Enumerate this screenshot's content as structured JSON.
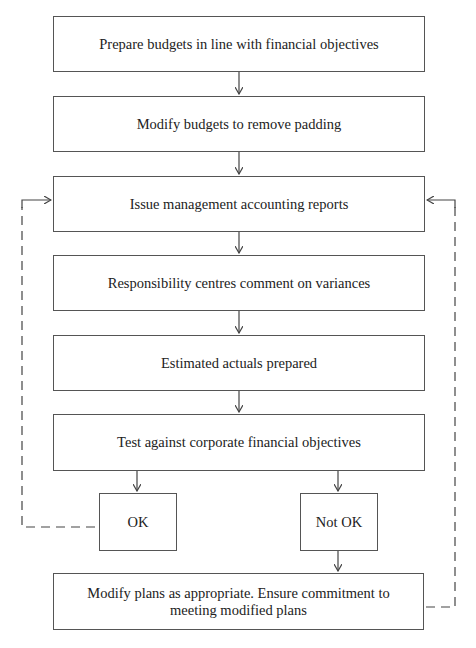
{
  "diagram": {
    "type": "flowchart",
    "nodes": [
      {
        "id": "prepare",
        "label": "Prepare budgets in line with financial objectives"
      },
      {
        "id": "modify-budgets",
        "label": "Modify budgets to remove padding"
      },
      {
        "id": "issue-reports",
        "label": "Issue management accounting reports"
      },
      {
        "id": "comment-variances",
        "label": "Responsibility centres comment on variances"
      },
      {
        "id": "estimated-actuals",
        "label": "Estimated actuals prepared"
      },
      {
        "id": "test-objectives",
        "label": "Test against corporate financial objectives"
      },
      {
        "id": "ok",
        "label": "OK"
      },
      {
        "id": "not-ok",
        "label": "Not OK"
      },
      {
        "id": "modify-plans",
        "label": "Modify plans as appropriate. Ensure commitment to meeting modified plans",
        "lines": [
          "Modify plans as appropriate. Ensure commitment to",
          "meeting modified plans"
        ]
      }
    ],
    "edges": [
      {
        "from": "prepare",
        "to": "modify-budgets",
        "style": "solid"
      },
      {
        "from": "modify-budgets",
        "to": "issue-reports",
        "style": "solid"
      },
      {
        "from": "issue-reports",
        "to": "comment-variances",
        "style": "solid"
      },
      {
        "from": "comment-variances",
        "to": "estimated-actuals",
        "style": "solid"
      },
      {
        "from": "estimated-actuals",
        "to": "test-objectives",
        "style": "solid"
      },
      {
        "from": "test-objectives",
        "to": "ok",
        "style": "solid"
      },
      {
        "from": "test-objectives",
        "to": "not-ok",
        "style": "solid"
      },
      {
        "from": "not-ok",
        "to": "modify-plans",
        "style": "solid"
      },
      {
        "from": "ok",
        "to": "issue-reports",
        "style": "dashed"
      },
      {
        "from": "modify-plans",
        "to": "issue-reports",
        "style": "dashed"
      }
    ]
  },
  "colors": {
    "line": "#444444",
    "border": "#555555",
    "text": "#222222",
    "background": "#ffffff"
  }
}
